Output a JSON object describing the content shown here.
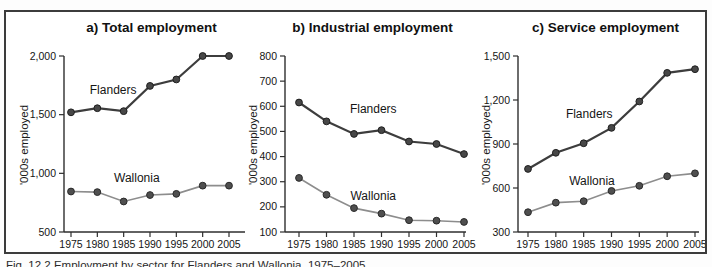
{
  "figure": {
    "caption": "Fig. 12.2 Employment by sector for Flanders and Wallonia, 1975–2005"
  },
  "colors": {
    "frame_border": "#3c3c3c",
    "axis": "#2e2e2e",
    "text": "#111111"
  },
  "chart_data": [
    {
      "type": "line",
      "title": "a) Total employment",
      "ylabel": "'000s employed",
      "x": [
        1975,
        1980,
        1985,
        1990,
        1995,
        2000,
        2005
      ],
      "ylim": [
        500,
        2000
      ],
      "yticks": [
        {
          "value": 500,
          "label": "500"
        },
        {
          "value": 1000,
          "label": "1,000"
        },
        {
          "value": 1500,
          "label": "1,500"
        },
        {
          "value": 2000,
          "label": "2,000"
        }
      ],
      "grid": false,
      "legend": "inline-labels",
      "series": [
        {
          "name": "Flanders",
          "values": [
            1520,
            1555,
            1530,
            1745,
            1800,
            2000,
            2000
          ],
          "line_color": "#3d3d3d",
          "line_width": 2.2,
          "marker_fill": "#474747",
          "marker_edge": "#1f1f1f",
          "label_anchor": {
            "x": 1983,
            "y": 1675
          }
        },
        {
          "name": "Wallonia",
          "values": [
            845,
            840,
            760,
            815,
            825,
            895,
            895
          ],
          "line_color": "#8d8d8d",
          "line_width": 1.6,
          "marker_fill": "#4f4f4f",
          "marker_edge": "#2a2a2a",
          "label_anchor": {
            "x": 1987.5,
            "y": 930
          }
        }
      ]
    },
    {
      "type": "line",
      "title": "b) Industrial employment",
      "ylabel": "'000s employed",
      "x": [
        1975,
        1980,
        1985,
        1990,
        1995,
        2000,
        2005
      ],
      "ylim": [
        100,
        800
      ],
      "yticks": [
        {
          "value": 100,
          "label": "100"
        },
        {
          "value": 200,
          "label": "200"
        },
        {
          "value": 300,
          "label": "300"
        },
        {
          "value": 400,
          "label": "400"
        },
        {
          "value": 500,
          "label": "500"
        },
        {
          "value": 600,
          "label": "600"
        },
        {
          "value": 700,
          "label": "700"
        },
        {
          "value": 800,
          "label": "800"
        }
      ],
      "grid": false,
      "legend": "inline-labels",
      "series": [
        {
          "name": "Flanders",
          "values": [
            615,
            540,
            490,
            505,
            460,
            450,
            410
          ],
          "line_color": "#3d3d3d",
          "line_width": 2.2,
          "marker_fill": "#474747",
          "marker_edge": "#1f1f1f",
          "label_anchor": {
            "x": 1988.5,
            "y": 572
          }
        },
        {
          "name": "Wallonia",
          "values": [
            315,
            248,
            195,
            173,
            147,
            145,
            140
          ],
          "line_color": "#8d8d8d",
          "line_width": 1.6,
          "marker_fill": "#4f4f4f",
          "marker_edge": "#2a2a2a",
          "label_anchor": {
            "x": 1988.5,
            "y": 228
          }
        }
      ]
    },
    {
      "type": "line",
      "title": "c) Service employment",
      "ylabel": "'000s employed",
      "x": [
        1975,
        1980,
        1985,
        1990,
        1995,
        2000,
        2005
      ],
      "ylim": [
        300,
        1500
      ],
      "yticks": [
        {
          "value": 300,
          "label": "300"
        },
        {
          "value": 600,
          "label": "600"
        },
        {
          "value": 900,
          "label": "900"
        },
        {
          "value": 1200,
          "label": "1,200"
        },
        {
          "value": 1500,
          "label": "1,500"
        }
      ],
      "grid": false,
      "legend": "inline-labels",
      "series": [
        {
          "name": "Flanders",
          "values": [
            730,
            840,
            905,
            1010,
            1190,
            1385,
            1410
          ],
          "line_color": "#3d3d3d",
          "line_width": 2.2,
          "marker_fill": "#474747",
          "marker_edge": "#1f1f1f",
          "label_anchor": {
            "x": 1986,
            "y": 1080
          }
        },
        {
          "name": "Wallonia",
          "values": [
            435,
            500,
            510,
            580,
            615,
            680,
            700
          ],
          "line_color": "#8d8d8d",
          "line_width": 1.6,
          "marker_fill": "#4f4f4f",
          "marker_edge": "#2a2a2a",
          "label_anchor": {
            "x": 1986.5,
            "y": 622
          }
        }
      ]
    }
  ]
}
